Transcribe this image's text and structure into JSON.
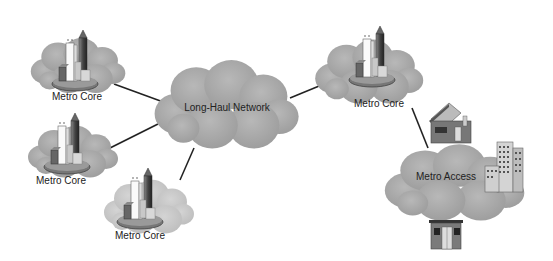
{
  "diagram": {
    "nodes": [
      {
        "id": "core1",
        "label": "Metro Core",
        "type": "metro-core"
      },
      {
        "id": "core2",
        "label": "Metro Core",
        "type": "metro-core"
      },
      {
        "id": "core3",
        "label": "Metro Core",
        "type": "metro-core"
      },
      {
        "id": "core4",
        "label": "Metro Core",
        "type": "metro-core"
      },
      {
        "id": "longhaul",
        "label": "Long-Haul Network",
        "type": "cloud"
      },
      {
        "id": "access",
        "label": "Metro Access",
        "type": "cloud"
      }
    ],
    "edges": [
      {
        "from": "core1",
        "to": "longhaul"
      },
      {
        "from": "core2",
        "to": "longhaul"
      },
      {
        "from": "core3",
        "to": "longhaul"
      },
      {
        "from": "longhaul",
        "to": "core4"
      },
      {
        "from": "core4",
        "to": "access"
      }
    ],
    "access_endpoints": [
      "house",
      "office-building",
      "store"
    ],
    "colors": {
      "cloud": "#a8a8a8",
      "cloud_light": "#c4c4c4",
      "line": "#222222",
      "building_dark": "#555555"
    }
  }
}
